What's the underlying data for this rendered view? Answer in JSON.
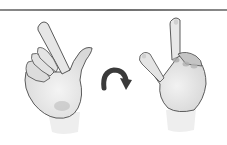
{
  "figure": {
    "elements": [
      {
        "name": "left-hand",
        "pose": "index finger raised, palm facing viewer, tilted left"
      },
      {
        "name": "rotation-arrow",
        "direction": "clockwise arc, left to right"
      },
      {
        "name": "right-hand",
        "pose": "index finger raised, back of hand facing viewer, upright"
      }
    ]
  },
  "colors": {
    "rule": "#707070",
    "arrow": "#3a3a3a",
    "skin_fill": "#ededed",
    "skin_shadow": "#c8c8c8",
    "outline": "#4a4a4a"
  }
}
